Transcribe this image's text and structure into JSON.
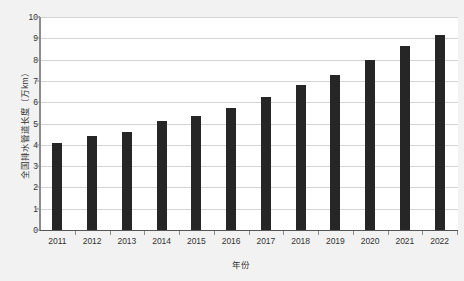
{
  "chart_data": {
    "type": "bar",
    "title": "",
    "subtitle": "",
    "xlabel": "年份",
    "ylabel": "全国排水管道长度（万km）",
    "categories": [
      "2011",
      "2012",
      "2013",
      "2014",
      "2015",
      "2016",
      "2017",
      "2018",
      "2019",
      "2020",
      "2021",
      "2022"
    ],
    "values": [
      4.1,
      4.4,
      4.6,
      5.1,
      5.35,
      5.75,
      6.25,
      6.8,
      7.3,
      8.0,
      8.65,
      9.15
    ],
    "ylim": [
      0,
      10
    ],
    "ytick_step": 1,
    "ytick_labels": [
      "0",
      "1",
      "2",
      "3",
      "4",
      "5",
      "6",
      "7",
      "8",
      "9",
      "10"
    ],
    "grid": true,
    "grid_axis": "y",
    "legend": false,
    "legend_position": "none",
    "bar_color": "#262626",
    "grid_color": "#d4d4d4",
    "axis_color": "#8c8c8c",
    "plot_background": "#ffffff",
    "figure_background": "#f2f2f2",
    "text_color": "#333333"
  }
}
